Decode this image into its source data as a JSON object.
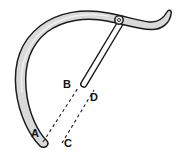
{
  "figure": {
    "background_color": "#ffffff",
    "band": {
      "fill_color": "#d9d9d9",
      "stroke_color": "#1a1a1a",
      "description": "thick curved hook-shaped band sweeping from lower left up over the top and out to a flicked tail at the upper right"
    },
    "rod": {
      "fill_color": "#fdfdfd",
      "stroke_color": "#1a1a1a",
      "description": "thin straight rod hinged at the ring on the band, its rounded tip ending at point B"
    },
    "pivot": {
      "name": "pivot-ring",
      "fill_color": "#e6e6e6",
      "stroke_color": "#1a1a1a",
      "cx": 119,
      "cy": 20,
      "r": 4.2
    },
    "dashed_lines": [
      {
        "name": "dashed-line-A-to-B",
        "from": "A",
        "to": "B",
        "x1": 43,
        "y1": 142,
        "x2": 78,
        "y2": 88,
        "stroke_color": "#1a1a1a",
        "dash": "3 3"
      },
      {
        "name": "dashed-line-C-to-D",
        "from": "C",
        "to": "D",
        "x1": 62,
        "y1": 143,
        "x2": 94,
        "y2": 90,
        "stroke_color": "#1a1a1a",
        "dash": "3 3"
      }
    ],
    "labels": [
      {
        "id": "A",
        "text": "A",
        "x": 31,
        "y": 128
      },
      {
        "id": "B",
        "text": "B",
        "x": 63,
        "y": 79
      },
      {
        "id": "C",
        "text": "C",
        "x": 64,
        "y": 138
      },
      {
        "id": "D",
        "text": "D",
        "x": 90,
        "y": 92
      }
    ]
  }
}
